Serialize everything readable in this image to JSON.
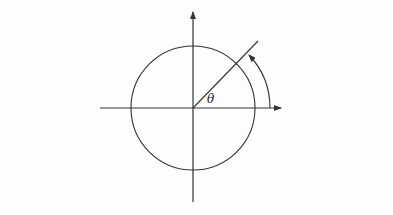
{
  "diagram": {
    "title": "",
    "labels": {
      "angle": "θ"
    },
    "colors": {
      "background": "#fdfdfd",
      "stroke": "#333333"
    },
    "geometry": {
      "origin": [
        193,
        108
      ],
      "circle_radius": 62,
      "radial_line_angle_deg": 45,
      "arc_radius": 77
    },
    "elements": [
      {
        "name": "x-axis",
        "type": "arrow",
        "direction": "right"
      },
      {
        "name": "y-axis",
        "type": "arrow",
        "direction": "up"
      },
      {
        "name": "unit-circle",
        "type": "circle"
      },
      {
        "name": "radial-line",
        "type": "line",
        "angle": "θ"
      },
      {
        "name": "angle-arc",
        "type": "arc-arrow",
        "from": "x-axis",
        "to": "radial-line"
      }
    ]
  }
}
